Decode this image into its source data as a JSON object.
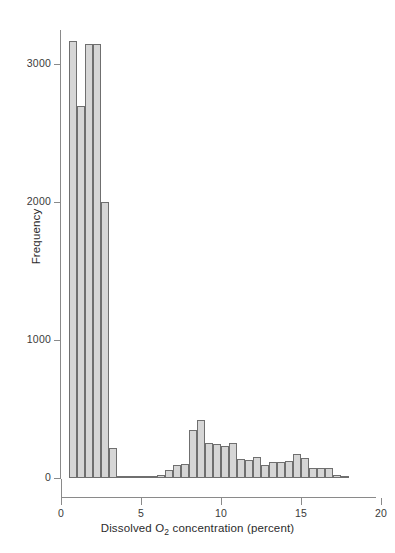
{
  "chart_data": {
    "type": "bar",
    "title": "",
    "subtitle": "",
    "xlabel": "Dissolved O2 concentration (percent)",
    "xlabel_parts": {
      "before": "Dissolved O",
      "sub": "2",
      "after": " concentration (percent)"
    },
    "ylabel": "Frequency",
    "xlim": [
      0,
      20
    ],
    "ylim": [
      0,
      3250
    ],
    "xticks": [
      0,
      5,
      10,
      15,
      20
    ],
    "xtick_labels": [
      "0",
      "5",
      "10",
      "15",
      "20"
    ],
    "yticks": [
      0,
      1000,
      2000,
      3000
    ],
    "ytick_labels": [
      "0",
      "1000",
      "2000",
      "3000"
    ],
    "grid": false,
    "legend": null,
    "bin_width": 0.5,
    "bar_fill_color": "#d6d6d6",
    "bar_edge_color": "#6f6f6f",
    "axis_color": "#8a8a8a",
    "bins": [
      {
        "x0": 0.5,
        "x1": 1.0,
        "value": 3170
      },
      {
        "x0": 1.0,
        "x1": 1.5,
        "value": 2700
      },
      {
        "x0": 1.5,
        "x1": 2.0,
        "value": 3150
      },
      {
        "x0": 2.0,
        "x1": 2.5,
        "value": 3150
      },
      {
        "x0": 2.5,
        "x1": 3.0,
        "value": 2000
      },
      {
        "x0": 3.0,
        "x1": 3.5,
        "value": 215
      },
      {
        "x0": 3.5,
        "x1": 4.0,
        "value": 10
      },
      {
        "x0": 4.0,
        "x1": 4.5,
        "value": 8
      },
      {
        "x0": 4.5,
        "x1": 5.0,
        "value": 8
      },
      {
        "x0": 5.0,
        "x1": 5.5,
        "value": 10
      },
      {
        "x0": 5.5,
        "x1": 6.0,
        "value": 10
      },
      {
        "x0": 6.0,
        "x1": 6.5,
        "value": 22
      },
      {
        "x0": 6.5,
        "x1": 7.0,
        "value": 55
      },
      {
        "x0": 7.0,
        "x1": 7.5,
        "value": 95
      },
      {
        "x0": 7.5,
        "x1": 8.0,
        "value": 100
      },
      {
        "x0": 8.0,
        "x1": 8.5,
        "value": 345
      },
      {
        "x0": 8.5,
        "x1": 9.0,
        "value": 420
      },
      {
        "x0": 9.0,
        "x1": 9.5,
        "value": 255
      },
      {
        "x0": 9.5,
        "x1": 10.0,
        "value": 250
      },
      {
        "x0": 10.0,
        "x1": 10.5,
        "value": 235
      },
      {
        "x0": 10.5,
        "x1": 11.0,
        "value": 255
      },
      {
        "x0": 11.0,
        "x1": 11.5,
        "value": 135
      },
      {
        "x0": 11.5,
        "x1": 12.0,
        "value": 130
      },
      {
        "x0": 12.0,
        "x1": 12.5,
        "value": 150
      },
      {
        "x0": 12.5,
        "x1": 13.0,
        "value": 95
      },
      {
        "x0": 13.0,
        "x1": 13.5,
        "value": 115
      },
      {
        "x0": 13.5,
        "x1": 14.0,
        "value": 115
      },
      {
        "x0": 14.0,
        "x1": 14.5,
        "value": 120
      },
      {
        "x0": 14.5,
        "x1": 15.0,
        "value": 175
      },
      {
        "x0": 15.0,
        "x1": 15.5,
        "value": 145
      },
      {
        "x0": 15.5,
        "x1": 16.0,
        "value": 75
      },
      {
        "x0": 16.0,
        "x1": 16.5,
        "value": 70
      },
      {
        "x0": 16.5,
        "x1": 17.0,
        "value": 70
      },
      {
        "x0": 17.0,
        "x1": 17.5,
        "value": 25
      },
      {
        "x0": 17.5,
        "x1": 18.0,
        "value": 6
      }
    ]
  },
  "caption": ""
}
